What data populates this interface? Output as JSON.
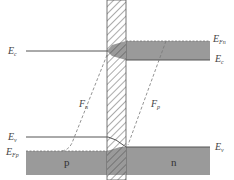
{
  "diagram": {
    "type": "band-diagram",
    "labels": {
      "left_conduction": {
        "main": "E",
        "sub": "c"
      },
      "left_valence": {
        "main": "E",
        "sub": "v"
      },
      "left_fermi_p": {
        "main": "E",
        "sub": "Fp"
      },
      "right_fermi_n": {
        "main": "E",
        "sub": "Fn"
      },
      "right_conduction": {
        "main": "E",
        "sub": "c"
      },
      "right_valence": {
        "main": "E",
        "sub": "v"
      },
      "quasi_fermi_n": {
        "main": "F",
        "sub": "n"
      },
      "quasi_fermi_p": {
        "main": "F",
        "sub": "p"
      }
    },
    "regions": {
      "left": "p",
      "right": "n"
    },
    "colors": {
      "band_fill": "#9a9a9a",
      "line": "#555555",
      "hatch": "#666666",
      "dashed": "#777777"
    }
  }
}
